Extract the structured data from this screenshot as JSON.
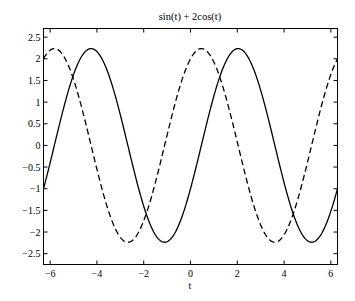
{
  "chart_data": {
    "type": "line",
    "title": "sin(t) + 2cos(t)",
    "xlabel": "t",
    "ylabel": "",
    "xlim": [
      -6.2832,
      6.2832
    ],
    "ylim": [
      -2.75,
      2.7
    ],
    "grid": false,
    "legend": null,
    "xticks": [
      -6,
      -4,
      -2,
      0,
      2,
      4,
      6
    ],
    "xtick_labels": [
      "−6",
      "−4",
      "−2",
      "0",
      "2",
      "4",
      "6"
    ],
    "yticks": [
      2.5,
      2,
      1.5,
      1,
      0.5,
      0,
      -0.5,
      -1,
      -1.5,
      -2,
      -2.5
    ],
    "ytick_labels": [
      "2.5",
      "2",
      "1.5",
      "1",
      "0.5",
      "0",
      "−0.5",
      "−1",
      "−1.5",
      "−2",
      "−2.5"
    ],
    "series": [
      {
        "name": "solid",
        "style": "solid",
        "expression": "2sin(t) - cos(t)",
        "x": [
          -6.2832,
          -5.5,
          -4.25,
          -3,
          -2,
          -1.11,
          0,
          1,
          2.03,
          3,
          4,
          5.18,
          6.2832
        ],
        "values": [
          -1.0,
          0.72,
          2.236,
          0.71,
          -1.4,
          -2.236,
          -1.0,
          1.14,
          2.236,
          1.27,
          -0.86,
          -2.236,
          -1.0
        ]
      },
      {
        "name": "dashed",
        "style": "dashed",
        "expression": "sin(t) + 2cos(t)",
        "x": [
          -6.2832,
          -5.82,
          -4.5,
          -3,
          -2.68,
          -1.5,
          0,
          0.46,
          1.5,
          3,
          3.61,
          5,
          6.2832
        ],
        "values": [
          2.0,
          2.236,
          0.56,
          -2.12,
          -2.236,
          -0.86,
          2.0,
          2.236,
          1.14,
          -1.84,
          -2.236,
          -0.39,
          2.0
        ]
      }
    ]
  },
  "colors": {
    "line": "#000000",
    "axes": "#000000",
    "background": "#ffffff"
  }
}
